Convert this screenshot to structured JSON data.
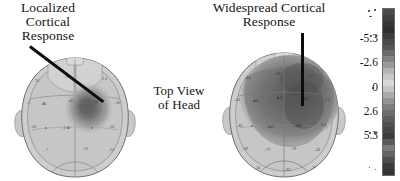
{
  "figure": {
    "title_left": "Localized\nCortical\nResponse",
    "title_right": "Widespread Cortical\nResponse",
    "center_label": "Top View\nof Head",
    "background_color": "#ffffff",
    "ink_color": "#141414"
  },
  "panels": [
    {
      "id": "left-head",
      "name": "localized-cortical-response-head",
      "caption": "Localized Cortical Response",
      "view": "top view of head",
      "activation": "localized",
      "activation_location": "right central region",
      "pointer": "diagonal leader line from upper-left caption to activation focus"
    },
    {
      "id": "right-head",
      "name": "widespread-cortical-response-head",
      "caption": "Widespread Cortical Response",
      "view": "top view of head",
      "activation": "widespread",
      "activation_location": "anterior two-thirds, right-dominant",
      "pointer": "vertical leader line from caption down to activation area"
    }
  ],
  "colorbar": {
    "name": "grayscale-intensity-colorbar",
    "orientation": "vertical",
    "ticks": [
      "-5.3",
      "-2.6",
      "0",
      "2.6",
      "5.3"
    ],
    "tick_positions_pct": [
      20,
      34,
      48,
      62,
      76
    ],
    "min": -5.3,
    "max": 5.3,
    "swatches": [
      "#4a4a4a",
      "#3f3f3f",
      "#363636",
      "#2e2e2e",
      "#3b3b3b",
      "#4a4a4a",
      "#565656",
      "#6b6b6b",
      "#828282",
      "#9a9a9a",
      "#b4b4b4",
      "#c8c8c8",
      "#d8d8d8",
      "#c4c4c4",
      "#ababab",
      "#949494",
      "#7e7e7e",
      "#6d6d6d",
      "#5d5d5d",
      "#515151",
      "#474747",
      "#3d3d3d",
      "#5a5a5a",
      "#7a7a7a",
      "#646464",
      "#4e4e4e",
      "#3c3c3c",
      "#353535"
    ]
  },
  "chart_data": {
    "type": "heatmap",
    "panels": [
      {
        "label": "Localized Cortical Response",
        "activation_extent_pct": 14,
        "peak_intensity": -5.3,
        "focus_normalized_xy": [
          0.62,
          0.42
        ]
      },
      {
        "label": "Widespread Cortical Response",
        "activation_extent_pct": 58,
        "peak_intensity": -5.3,
        "focus_normalized_xy": [
          0.6,
          0.34
        ]
      }
    ],
    "colorbar_ticks": [
      -5.3,
      -2.6,
      0,
      2.6,
      5.3
    ],
    "colormap": "grayscale",
    "xlabel": "",
    "ylabel": "",
    "legend_position": "right"
  }
}
